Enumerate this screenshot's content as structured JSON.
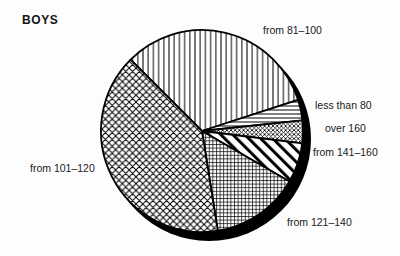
{
  "chart_data": {
    "type": "pie",
    "title": "BOYS",
    "legend_position": "outside-callout-labels",
    "start_angle_deg": 135,
    "direction": "clockwise",
    "slices": [
      {
        "label": "from 81–100",
        "percent": 32.5,
        "angle_deg": 117,
        "pattern": "vertical-lines"
      },
      {
        "label": "less than 80",
        "percent": 3.3,
        "angle_deg": 12,
        "pattern": "horizontal-lines"
      },
      {
        "label": "over 160",
        "percent": 3.6,
        "angle_deg": 13,
        "pattern": "fine-diamond"
      },
      {
        "label": "from 141–160",
        "percent": 6.4,
        "angle_deg": 23,
        "pattern": "wide-stripes"
      },
      {
        "label": "from 121–140",
        "percent": 14.2,
        "angle_deg": 51,
        "pattern": "fine-grid"
      },
      {
        "label": "from 101–120",
        "percent": 40.0,
        "angle_deg": 144,
        "pattern": "diagonal-crosshatch"
      }
    ],
    "colors": {
      "ink": "#000000",
      "fill_background": "#ffffff",
      "shadow": "#000000",
      "text": "#1a1a1a"
    },
    "style": "monochrome hatched pie with offset black drop shadow"
  }
}
